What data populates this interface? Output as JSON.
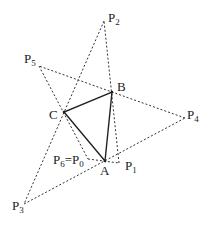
{
  "diagram": {
    "points": {
      "P0": {
        "x": 88,
        "y": 159
      },
      "P1": {
        "x": 119,
        "y": 163
      },
      "P2": {
        "x": 104,
        "y": 21
      },
      "P3": {
        "x": 24,
        "y": 204
      },
      "P4": {
        "x": 185,
        "y": 118
      },
      "P5": {
        "x": 39,
        "y": 66
      },
      "A": {
        "x": 105,
        "y": 161
      },
      "B": {
        "x": 112,
        "y": 92
      },
      "C": {
        "x": 64,
        "y": 112
      }
    },
    "labels": {
      "P2": {
        "base": "P",
        "sub": "2"
      },
      "P5": {
        "base": "P",
        "sub": "5"
      },
      "B": {
        "base": "B",
        "sub": ""
      },
      "C": {
        "base": "C",
        "sub": ""
      },
      "P4": {
        "base": "P",
        "sub": "4"
      },
      "P6P0": {
        "base1": "P",
        "sub1": "6",
        "eq": "=",
        "base2": "P",
        "sub2": "0"
      },
      "A": {
        "base": "A",
        "sub": ""
      },
      "P1": {
        "base": "P",
        "sub": "1"
      },
      "P3": {
        "base": "P",
        "sub": "3"
      }
    },
    "triangle": [
      "A",
      "B",
      "C"
    ],
    "dashed_path": [
      "P0",
      "P1",
      "P2",
      "P3",
      "P4",
      "P5",
      "P0"
    ],
    "colors": {
      "stroke": "#222222",
      "dash": "#333333",
      "background": "#ffffff"
    }
  }
}
